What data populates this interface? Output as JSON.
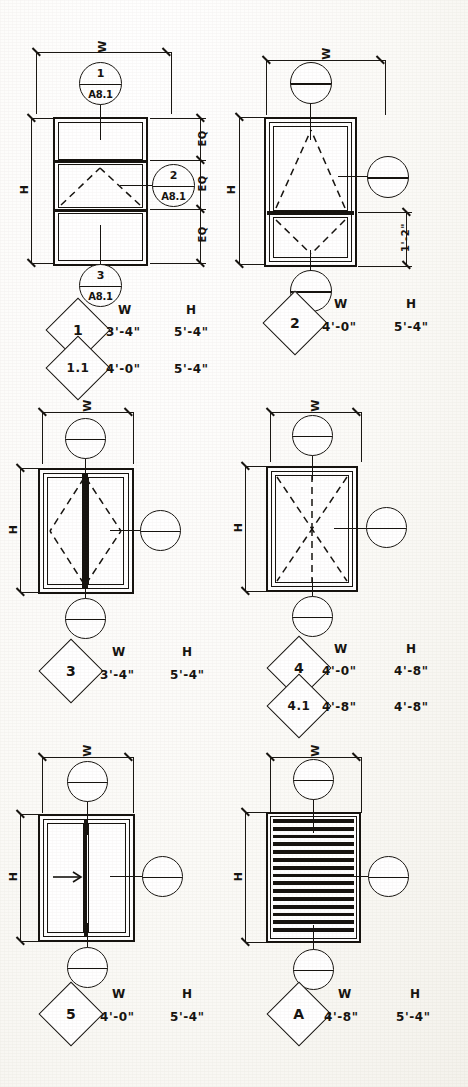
{
  "sheet": {
    "kind": "window-and-louver-schedule-elevations",
    "dimension_labels": {
      "width": "W",
      "height": "H",
      "equal": "EQ"
    },
    "column_headers": {
      "width": "W",
      "height": "H"
    }
  },
  "types": [
    {
      "tag": "1",
      "style": "triple-stack-awning-center",
      "width": "3'-4\"",
      "height": "5'-4\"",
      "w_header": "W",
      "h_header": "H",
      "dim_w_label": "W",
      "dim_h_label": "H",
      "eq_labels": [
        "EQ",
        "EQ",
        "EQ"
      ],
      "callouts": [
        {
          "detail": "1",
          "sheet": "A8.1",
          "position": "top"
        },
        {
          "detail": "2",
          "sheet": "A8.1",
          "position": "right"
        },
        {
          "detail": "3",
          "sheet": "A8.1",
          "position": "bottom"
        }
      ],
      "variant": {
        "tag": "1.1",
        "width": "4'-0\"",
        "height": "5'-4\""
      }
    },
    {
      "tag": "2",
      "style": "awning-over-hopper",
      "width": "4'-0\"",
      "height": "5'-4\"",
      "w_header": "W",
      "h_header": "H",
      "dim_w_label": "W",
      "dim_h_label": "H",
      "detail_dim": "1'-2\"",
      "callouts": [
        {
          "detail": "",
          "sheet": "",
          "position": "top"
        },
        {
          "detail": "",
          "sheet": "",
          "position": "right"
        },
        {
          "detail": "",
          "sheet": "",
          "position": "bottom"
        }
      ]
    },
    {
      "tag": "3",
      "style": "double-casement-pair",
      "width": "3'-4\"",
      "height": "5'-4\"",
      "w_header": "W",
      "h_header": "H",
      "dim_w_label": "W",
      "dim_h_label": "H",
      "callouts": [
        {
          "detail": "",
          "sheet": "",
          "position": "top"
        },
        {
          "detail": "",
          "sheet": "",
          "position": "right"
        },
        {
          "detail": "",
          "sheet": "",
          "position": "bottom"
        }
      ]
    },
    {
      "tag": "4",
      "style": "single-fixed-with-x-swing",
      "width": "4'-0\"",
      "height": "4'-8\"",
      "w_header": "W",
      "h_header": "H",
      "dim_w_label": "W",
      "dim_h_label": "H",
      "callouts": [
        {
          "detail": "",
          "sheet": "",
          "position": "top"
        },
        {
          "detail": "",
          "sheet": "",
          "position": "right"
        },
        {
          "detail": "",
          "sheet": "",
          "position": "bottom"
        }
      ],
      "variant": {
        "tag": "4.1",
        "width": "4'-8\"",
        "height": "4'-8\""
      }
    },
    {
      "tag": "5",
      "style": "horizontal-slider",
      "width": "4'-0\"",
      "height": "5'-4\"",
      "w_header": "W",
      "h_header": "H",
      "dim_w_label": "W",
      "dim_h_label": "H",
      "slide_direction": "right",
      "callouts": [
        {
          "detail": "",
          "sheet": "",
          "position": "top"
        },
        {
          "detail": "",
          "sheet": "",
          "position": "right"
        },
        {
          "detail": "",
          "sheet": "",
          "position": "bottom"
        }
      ]
    },
    {
      "tag": "A",
      "style": "fixed-louver",
      "width": "4'-8\"",
      "height": "5'-4\"",
      "w_header": "W",
      "h_header": "H",
      "dim_w_label": "W",
      "dim_h_label": "H",
      "louver_slat_count": 15,
      "callouts": [
        {
          "detail": "",
          "sheet": "",
          "position": "top"
        },
        {
          "detail": "",
          "sheet": "",
          "position": "right"
        },
        {
          "detail": "",
          "sheet": "",
          "position": "bottom"
        }
      ]
    }
  ],
  "colors": {
    "ink": "#16130f",
    "paper": "#fdfdfb"
  }
}
